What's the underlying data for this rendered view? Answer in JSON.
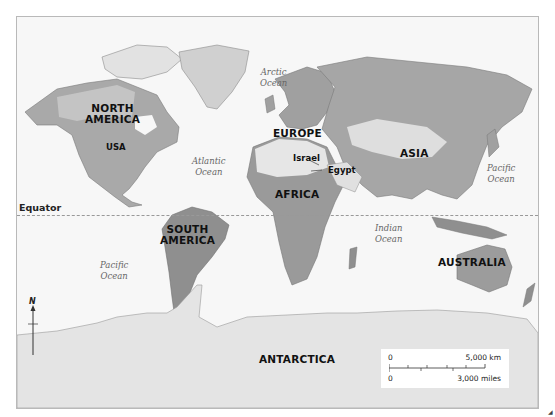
{
  "map": {
    "type": "world physical map (grayscale shaded relief)",
    "continents": [
      {
        "id": "north-america",
        "label_line1": "NORTH",
        "label_line2": "AMERICA"
      },
      {
        "id": "south-america",
        "label_line1": "SOUTH",
        "label_line2": "AMERICA"
      },
      {
        "id": "europe",
        "label": "EUROPE"
      },
      {
        "id": "africa",
        "label": "AFRICA"
      },
      {
        "id": "asia",
        "label": "ASIA"
      },
      {
        "id": "australia",
        "label": "AUSTRALIA"
      },
      {
        "id": "antarctica",
        "label": "ANTARCTICA"
      }
    ],
    "countries": [
      {
        "id": "usa",
        "label": "USA"
      },
      {
        "id": "israel",
        "label": "Israel"
      },
      {
        "id": "egypt",
        "label": "Egypt"
      }
    ],
    "oceans": [
      {
        "id": "arctic",
        "line1": "Arctic",
        "line2": "Ocean"
      },
      {
        "id": "atlantic",
        "line1": "Atlantic",
        "line2": "Ocean"
      },
      {
        "id": "pacific-east",
        "line1": "Pacific",
        "line2": "Ocean"
      },
      {
        "id": "pacific-west",
        "line1": "Pacific",
        "line2": "Ocean"
      },
      {
        "id": "indian",
        "line1": "Indian",
        "line2": "Ocean"
      }
    ],
    "equator_label": "Equator",
    "north_arrow_label": "N",
    "scale_bar": {
      "km_zero": "0",
      "km_value": "5,000 km",
      "miles_zero": "0",
      "miles_value": "3,000 miles"
    },
    "colors": {
      "ocean": "#f7f7f7",
      "land_light": "#d8d8d8",
      "land_mid": "#a9a9a9",
      "land_dark": "#7f7f7f",
      "desert": "#e6e6e6",
      "ice": "#ececec",
      "border": "#b9b9b9"
    }
  }
}
